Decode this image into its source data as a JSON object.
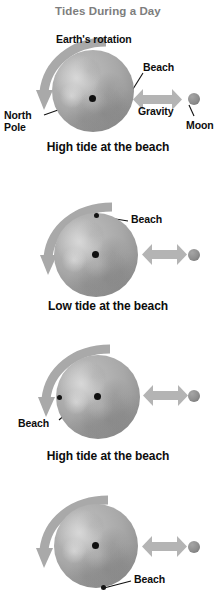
{
  "figure": {
    "title": "Tides During a Day",
    "title_color": "#7d7d7d",
    "background_color": "#ffffff",
    "earth_color": "#a8a8a8",
    "moon_color": "#8e8e8e",
    "arrow_color": "#a9a9a9",
    "text_color": "#0d0d0d",
    "width": 216,
    "height": 603
  },
  "panels": [
    {
      "id": "panel-1",
      "caption": "High tide at the beach",
      "rotation_label": "Earth's rotation",
      "beach_label": "Beach",
      "beach_position": "right",
      "north_pole_label_line1": "North",
      "north_pole_label_line2": "Pole",
      "gravity_label": "Gravity",
      "moon_label": "Moon"
    },
    {
      "id": "panel-2",
      "caption": "Low tide at the beach",
      "beach_label": "Beach",
      "beach_position": "top"
    },
    {
      "id": "panel-3",
      "caption": "High tide at the beach",
      "beach_label": "Beach",
      "beach_position": "left"
    },
    {
      "id": "panel-4",
      "caption": "",
      "beach_label": "Beach",
      "beach_position": "bottom"
    }
  ]
}
